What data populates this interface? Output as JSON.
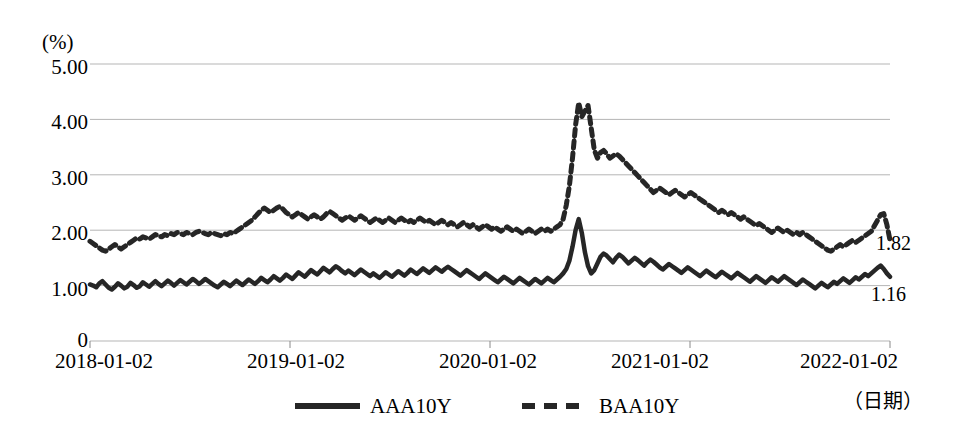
{
  "chart_data": {
    "type": "line",
    "title": "",
    "subtitle": "",
    "xlabel": "（日期）",
    "ylabel": "(%)",
    "ylim": [
      0,
      5
    ],
    "xlim": [
      "2018-01-02",
      "2022-04-30"
    ],
    "grid": true,
    "legend_position": "bottom",
    "y_unit_label": "(%)",
    "y_ticks": [
      "5.00",
      "4.00",
      "3.00",
      "2.00",
      "1.00",
      "0"
    ],
    "y_tick_values": [
      5,
      4,
      3,
      2,
      1,
      0
    ],
    "x_ticks": [
      "2018-01-02",
      "2019-01-02",
      "2020-01-02",
      "2021-01-02",
      "2022-01-02"
    ],
    "end_labels": [
      {
        "series": "BAA10Y",
        "value": "1.82"
      },
      {
        "series": "AAA10Y",
        "value": "1.16"
      }
    ],
    "series": [
      {
        "name": "AAA10Y",
        "style": "solid",
        "color": "#262626",
        "values": [
          1.02,
          1.0,
          0.97,
          1.04,
          1.08,
          1.02,
          0.96,
          0.93,
          0.98,
          1.04,
          1.0,
          0.95,
          0.98,
          1.05,
          1.01,
          0.96,
          0.99,
          1.06,
          1.02,
          0.98,
          1.03,
          1.08,
          1.03,
          0.99,
          1.04,
          1.09,
          1.05,
          1.0,
          1.05,
          1.1,
          1.06,
          1.02,
          1.07,
          1.12,
          1.08,
          1.03,
          1.07,
          1.12,
          1.08,
          1.04,
          1.0,
          0.97,
          1.02,
          1.07,
          1.03,
          0.99,
          1.04,
          1.09,
          1.05,
          1.01,
          1.06,
          1.11,
          1.07,
          1.03,
          1.08,
          1.14,
          1.1,
          1.06,
          1.11,
          1.17,
          1.13,
          1.09,
          1.14,
          1.2,
          1.16,
          1.12,
          1.18,
          1.24,
          1.2,
          1.16,
          1.22,
          1.28,
          1.24,
          1.2,
          1.26,
          1.32,
          1.28,
          1.24,
          1.3,
          1.35,
          1.31,
          1.26,
          1.22,
          1.27,
          1.23,
          1.19,
          1.24,
          1.29,
          1.25,
          1.21,
          1.17,
          1.22,
          1.18,
          1.14,
          1.19,
          1.24,
          1.2,
          1.16,
          1.21,
          1.26,
          1.22,
          1.18,
          1.23,
          1.29,
          1.25,
          1.21,
          1.26,
          1.31,
          1.27,
          1.23,
          1.28,
          1.33,
          1.29,
          1.25,
          1.3,
          1.34,
          1.3,
          1.26,
          1.22,
          1.18,
          1.23,
          1.28,
          1.24,
          1.2,
          1.16,
          1.12,
          1.17,
          1.22,
          1.18,
          1.14,
          1.1,
          1.06,
          1.11,
          1.16,
          1.12,
          1.08,
          1.04,
          1.09,
          1.14,
          1.1,
          1.06,
          1.02,
          1.07,
          1.12,
          1.08,
          1.04,
          1.09,
          1.14,
          1.1,
          1.06,
          1.11,
          1.16,
          1.22,
          1.3,
          1.45,
          1.7,
          2.0,
          2.2,
          1.95,
          1.6,
          1.35,
          1.22,
          1.28,
          1.4,
          1.52,
          1.58,
          1.54,
          1.48,
          1.42,
          1.5,
          1.56,
          1.52,
          1.46,
          1.4,
          1.45,
          1.5,
          1.46,
          1.41,
          1.36,
          1.42,
          1.47,
          1.43,
          1.38,
          1.33,
          1.29,
          1.34,
          1.39,
          1.35,
          1.31,
          1.27,
          1.23,
          1.28,
          1.33,
          1.29,
          1.25,
          1.21,
          1.17,
          1.22,
          1.27,
          1.23,
          1.19,
          1.15,
          1.2,
          1.25,
          1.21,
          1.17,
          1.13,
          1.18,
          1.23,
          1.19,
          1.15,
          1.11,
          1.07,
          1.12,
          1.17,
          1.13,
          1.09,
          1.05,
          1.1,
          1.15,
          1.11,
          1.07,
          1.12,
          1.17,
          1.13,
          1.09,
          1.05,
          1.01,
          1.06,
          1.11,
          1.07,
          1.03,
          0.99,
          0.95,
          1.0,
          1.05,
          1.01,
          0.97,
          1.02,
          1.07,
          1.03,
          1.08,
          1.13,
          1.09,
          1.05,
          1.1,
          1.15,
          1.11,
          1.16,
          1.21,
          1.17,
          1.22,
          1.27,
          1.32,
          1.36,
          1.3,
          1.22,
          1.16
        ]
      },
      {
        "name": "BAA10Y",
        "style": "dashed",
        "color": "#262626",
        "values": [
          1.8,
          1.76,
          1.72,
          1.68,
          1.64,
          1.62,
          1.66,
          1.7,
          1.74,
          1.7,
          1.66,
          1.7,
          1.74,
          1.78,
          1.82,
          1.86,
          1.84,
          1.88,
          1.86,
          1.84,
          1.88,
          1.92,
          1.9,
          1.88,
          1.92,
          1.9,
          1.94,
          1.92,
          1.96,
          1.94,
          1.92,
          1.96,
          1.94,
          1.92,
          1.96,
          1.98,
          1.96,
          1.94,
          1.92,
          1.96,
          1.94,
          1.92,
          1.9,
          1.94,
          1.92,
          1.96,
          1.94,
          1.98,
          2.02,
          2.06,
          2.1,
          2.14,
          2.18,
          2.24,
          2.3,
          2.36,
          2.4,
          2.36,
          2.32,
          2.36,
          2.4,
          2.43,
          2.38,
          2.32,
          2.28,
          2.24,
          2.28,
          2.32,
          2.28,
          2.24,
          2.2,
          2.24,
          2.28,
          2.24,
          2.2,
          2.24,
          2.3,
          2.34,
          2.3,
          2.26,
          2.22,
          2.18,
          2.22,
          2.26,
          2.22,
          2.18,
          2.22,
          2.26,
          2.22,
          2.18,
          2.14,
          2.18,
          2.22,
          2.18,
          2.14,
          2.18,
          2.22,
          2.18,
          2.14,
          2.18,
          2.22,
          2.18,
          2.14,
          2.18,
          2.14,
          2.18,
          2.22,
          2.18,
          2.14,
          2.18,
          2.14,
          2.1,
          2.14,
          2.18,
          2.14,
          2.1,
          2.14,
          2.1,
          2.06,
          2.1,
          2.14,
          2.1,
          2.06,
          2.1,
          2.06,
          2.02,
          2.06,
          2.1,
          2.06,
          2.02,
          2.06,
          2.02,
          1.98,
          2.02,
          2.06,
          2.02,
          1.98,
          2.02,
          1.98,
          1.94,
          1.98,
          2.02,
          1.98,
          1.94,
          1.98,
          2.02,
          1.98,
          2.02,
          1.98,
          2.02,
          2.06,
          2.1,
          2.2,
          2.45,
          2.8,
          3.3,
          3.9,
          4.3,
          4.05,
          4.15,
          4.25,
          3.85,
          3.45,
          3.3,
          3.4,
          3.44,
          3.38,
          3.3,
          3.34,
          3.38,
          3.34,
          3.28,
          3.22,
          3.16,
          3.1,
          3.04,
          2.98,
          2.92,
          2.86,
          2.8,
          2.74,
          2.68,
          2.72,
          2.76,
          2.72,
          2.68,
          2.64,
          2.68,
          2.72,
          2.68,
          2.64,
          2.6,
          2.64,
          2.68,
          2.64,
          2.6,
          2.56,
          2.52,
          2.48,
          2.44,
          2.4,
          2.36,
          2.32,
          2.36,
          2.32,
          2.28,
          2.32,
          2.28,
          2.24,
          2.2,
          2.24,
          2.2,
          2.16,
          2.12,
          2.08,
          2.12,
          2.08,
          2.04,
          2.0,
          1.96,
          2.0,
          2.04,
          2.0,
          1.96,
          2.0,
          1.96,
          1.92,
          1.96,
          1.92,
          1.96,
          1.92,
          1.88,
          1.84,
          1.8,
          1.76,
          1.72,
          1.68,
          1.64,
          1.62,
          1.66,
          1.7,
          1.74,
          1.7,
          1.74,
          1.78,
          1.82,
          1.78,
          1.82,
          1.86,
          1.9,
          1.94,
          1.98,
          2.08,
          2.18,
          2.28,
          2.3,
          2.1,
          1.82
        ]
      }
    ]
  },
  "legend": {
    "items": [
      {
        "label": "AAA10Y",
        "style": "solid"
      },
      {
        "label": "BAA10Y",
        "style": "dashed"
      }
    ]
  }
}
